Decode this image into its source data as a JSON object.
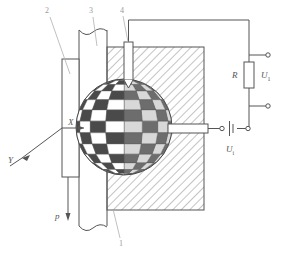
{
  "figure": {
    "type": "technical-diagram",
    "background_color": "#ffffff",
    "line_color": "#555555",
    "hatch_color": "#7a7a7a",
    "leader_color": "#b0b0b0"
  },
  "callouts": [
    {
      "id": "1",
      "label": "1",
      "refers_to": "hatched-body-block"
    },
    {
      "id": "2",
      "label": "2",
      "refers_to": "left-plate-electrode"
    },
    {
      "id": "3",
      "label": "3",
      "refers_to": "vertical-membrane-strip"
    },
    {
      "id": "4",
      "label": "4",
      "refers_to": "top-probe-electrode"
    }
  ],
  "axes": {
    "x_label": "X",
    "y_label": "Y"
  },
  "load": {
    "symbol": "p",
    "direction": "down"
  },
  "circuit": {
    "resistor_label": "R",
    "output_voltage_label": "U",
    "output_voltage_sub": "1",
    "input_voltage_label": "U",
    "input_voltage_sub": "i",
    "terminal_count": 2,
    "battery_label_position": "below"
  },
  "sphere": {
    "name": "checkered-spherical-element",
    "pattern": "checkerboard-lat-long-mesh",
    "center_x": 124,
    "center_y": 127,
    "radius": 48,
    "dark_color": "#4a4a4a",
    "light_color": "#ffffff"
  }
}
